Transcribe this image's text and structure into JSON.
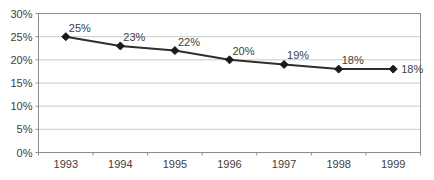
{
  "chart_data": {
    "type": "line",
    "title": "",
    "xlabel": "",
    "ylabel": "",
    "categories": [
      "1993",
      "1994",
      "1995",
      "1996",
      "1997",
      "1998",
      "1999"
    ],
    "values": [
      25,
      23,
      22,
      20,
      19,
      18,
      18
    ],
    "point_labels": [
      "25%",
      "23%",
      "22%",
      "20%",
      "19%",
      "18%",
      "18%"
    ],
    "ylim": [
      0,
      30
    ],
    "ytick_step": 5,
    "ytick_labels": [
      "0%",
      "5%",
      "10%",
      "15%",
      "20%",
      "25%",
      "30%"
    ],
    "grid": "horizontal",
    "legend_position": "none",
    "marker_shape": "diamond",
    "colors": {
      "line": "#2e2e2e",
      "marker": "#1a1a1a",
      "gridline": "#c9c9c9",
      "plot_border": "#8c8c8c",
      "tick": "#8c8c8c",
      "text": "#404040",
      "plot_background": "#ffffff",
      "page_background": "#ffffff"
    }
  }
}
